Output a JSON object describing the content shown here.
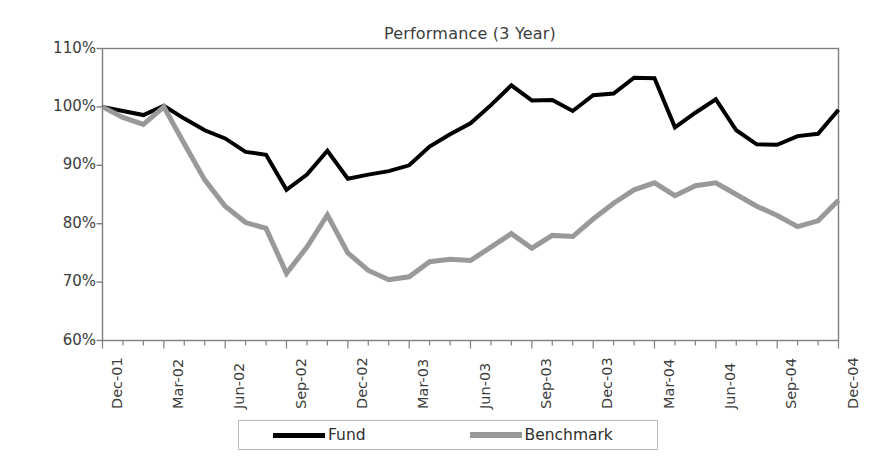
{
  "chart_data": {
    "type": "line",
    "title": "Performance (3 Year)",
    "xlabel": "",
    "ylabel": "",
    "ylim": [
      60,
      110
    ],
    "ytick_labels": [
      "110%",
      "100%",
      "90%",
      "80%",
      "70%",
      "60%"
    ],
    "ytick_values": [
      110,
      100,
      90,
      80,
      70,
      60
    ],
    "grid": false,
    "legend_position": "bottom",
    "x": [
      "Dec-01",
      "Jan-02",
      "Feb-02",
      "Mar-02",
      "Apr-02",
      "May-02",
      "Jun-02",
      "Jul-02",
      "Aug-02",
      "Sep-02",
      "Oct-02",
      "Nov-02",
      "Dec-02",
      "Jan-03",
      "Feb-03",
      "Mar-03",
      "Apr-03",
      "May-03",
      "Jun-03",
      "Jul-03",
      "Aug-03",
      "Sep-03",
      "Oct-03",
      "Nov-03",
      "Dec-03",
      "Jan-04",
      "Feb-04",
      "Mar-04",
      "Apr-04",
      "May-04",
      "Jun-04",
      "Jul-04",
      "Aug-04",
      "Sep-04",
      "Oct-04",
      "Nov-04",
      "Dec-04"
    ],
    "xtick_labels": [
      "Dec-01",
      "Mar-02",
      "Jun-02",
      "Sep-02",
      "Dec-02",
      "Mar-03",
      "Jun-03",
      "Sep-03",
      "Dec-03",
      "Mar-04",
      "Jun-04",
      "Sep-04",
      "Dec-04"
    ],
    "xtick_indices": [
      0,
      3,
      6,
      9,
      12,
      15,
      18,
      21,
      24,
      27,
      30,
      33,
      36
    ],
    "series": [
      {
        "name": "Fund",
        "color": "#000000",
        "width": 4,
        "values": [
          100.0,
          99.3,
          98.6,
          100.2,
          98.0,
          96.0,
          94.6,
          92.3,
          91.8,
          85.8,
          88.4,
          92.5,
          87.7,
          88.4,
          89.0,
          90.0,
          93.2,
          95.3,
          97.2,
          100.3,
          103.7,
          101.1,
          101.2,
          99.3,
          102.0,
          102.3,
          105.0,
          104.9,
          96.5,
          99.0,
          101.3,
          96.0,
          93.6,
          93.5,
          95.0,
          95.4,
          99.5
        ]
      },
      {
        "name": "Benchmark",
        "color": "#999999",
        "width": 5,
        "values": [
          100.0,
          98.2,
          97.0,
          100.0,
          93.7,
          87.5,
          83.0,
          80.2,
          79.2,
          71.5,
          76.0,
          81.5,
          75.0,
          72.0,
          70.4,
          70.9,
          73.5,
          73.9,
          73.7,
          76.0,
          78.3,
          75.8,
          78.0,
          77.8,
          80.8,
          83.5,
          85.8,
          87.0,
          84.8,
          86.5,
          87.0,
          85.0,
          83.0,
          81.4,
          79.5,
          80.5,
          84.0
        ]
      }
    ]
  },
  "legend": {
    "items": [
      {
        "label": "Fund",
        "color": "#000000"
      },
      {
        "label": "Benchmark",
        "color": "#999999"
      }
    ]
  },
  "axes": {
    "frame_color": "#7f7f7f"
  }
}
